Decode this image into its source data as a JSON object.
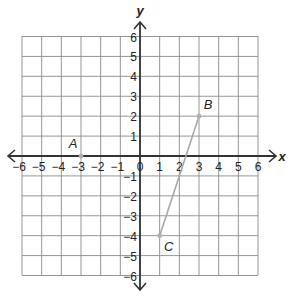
{
  "header": {
    "partial_text": "... g ... p ..."
  },
  "chart_data": {
    "type": "scatter",
    "title": "",
    "xlabel": "x",
    "ylabel": "y",
    "xlim": [
      -6,
      6
    ],
    "ylim": [
      -6,
      6
    ],
    "grid": true,
    "x_ticks": [
      "-6",
      "-5",
      "-4",
      "-3",
      "-2",
      "-1",
      "0",
      "1",
      "2",
      "3",
      "4",
      "5",
      "6"
    ],
    "y_ticks": [
      "6",
      "5",
      "4",
      "3",
      "2",
      "1",
      "-1",
      "-2",
      "-3",
      "-4",
      "-5",
      "-6"
    ],
    "points": [
      {
        "label": "A",
        "x": -3,
        "y": 0
      },
      {
        "label": "B",
        "x": 3,
        "y": 2
      },
      {
        "label": "C",
        "x": 1,
        "y": -4
      }
    ],
    "segments": [
      {
        "from": "C",
        "to": "B"
      }
    ]
  },
  "colors": {
    "grid": "#8a8a8a",
    "axis": "#333333",
    "point": "#b0b0b0",
    "segment": "#a8a8a8",
    "text": "#222222"
  }
}
